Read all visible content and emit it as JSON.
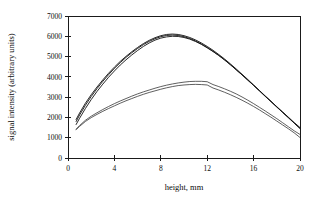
{
  "chart_data": {
    "type": "line",
    "title": "",
    "xlabel": "height, mm",
    "ylabel": "signal intensity (arbitrary units)",
    "xlim": [
      0,
      20
    ],
    "ylim": [
      0,
      7000
    ],
    "xticks": [
      0,
      4,
      8,
      12,
      16,
      20
    ],
    "yticks": [
      0,
      1000,
      2000,
      3000,
      4000,
      5000,
      6000,
      7000
    ],
    "xtick_labels": [
      "0",
      "4",
      "8",
      "12",
      "16",
      "20"
    ],
    "ytick_labels": [
      "0",
      "1000",
      "2000",
      "3000",
      "4000",
      "5000",
      "6000",
      "7000"
    ],
    "grid": false,
    "legend": false,
    "legend_position": "none",
    "frame": "box",
    "series": [
      {
        "name": "upper-curve-1",
        "x": [
          0.7,
          1.0,
          1.5,
          2.0,
          2.5,
          3.0,
          3.5,
          4.0,
          4.5,
          5.0,
          5.5,
          6.0,
          6.5,
          7.0,
          7.5,
          8.0,
          8.5,
          9.0,
          9.5,
          10.0,
          10.5,
          11.0,
          11.5,
          12.0,
          12.5,
          13.0,
          13.5,
          14.0,
          14.5,
          15.0,
          15.5,
          16.0,
          16.5,
          17.0,
          17.5,
          18.0,
          18.5,
          19.0,
          19.5,
          20.0
        ],
        "y": [
          1900,
          2220,
          2700,
          3120,
          3500,
          3850,
          4180,
          4480,
          4760,
          5010,
          5240,
          5450,
          5640,
          5800,
          5930,
          6030,
          6090,
          6110,
          6090,
          6030,
          5940,
          5820,
          5670,
          5500,
          5310,
          5100,
          4880,
          4640,
          4390,
          4130,
          3870,
          3600,
          3330,
          3060,
          2790,
          2520,
          2250,
          1990,
          1720,
          1470
        ]
      },
      {
        "name": "upper-curve-2",
        "x": [
          0.7,
          1.0,
          1.5,
          2.0,
          2.5,
          3.0,
          3.5,
          4.0,
          4.5,
          5.0,
          5.5,
          6.0,
          6.5,
          7.0,
          7.5,
          8.0,
          8.5,
          9.0,
          9.5,
          10.0,
          10.5,
          11.0,
          11.5,
          12.0,
          12.5,
          13.0,
          13.5,
          14.0,
          14.5,
          15.0,
          15.5,
          16.0,
          16.5,
          17.0,
          17.5,
          18.0,
          18.5,
          19.0,
          19.5,
          20.0
        ],
        "y": [
          1800,
          2120,
          2600,
          3030,
          3420,
          3780,
          4110,
          4420,
          4700,
          4960,
          5190,
          5400,
          5590,
          5750,
          5880,
          5980,
          6040,
          6060,
          6040,
          5980,
          5890,
          5770,
          5620,
          5450,
          5260,
          5060,
          4840,
          4600,
          4350,
          4100,
          3840,
          3580,
          3310,
          3040,
          2780,
          2510,
          2250,
          1990,
          1720,
          1450
        ]
      },
      {
        "name": "upper-curve-3",
        "x": [
          0.7,
          1.0,
          1.5,
          2.0,
          2.5,
          3.0,
          3.5,
          4.0,
          4.5,
          5.0,
          5.5,
          6.0,
          6.5,
          7.0,
          7.5,
          8.0,
          8.5,
          9.0,
          9.5,
          10.0,
          10.5,
          11.0,
          11.5,
          12.0,
          12.5,
          13.0,
          13.5,
          14.0,
          14.5,
          15.0,
          15.5,
          16.0,
          16.5,
          17.0,
          17.5,
          18.0,
          18.5,
          19.0,
          19.5,
          20.0
        ],
        "y": [
          1650,
          1960,
          2440,
          2880,
          3280,
          3640,
          3980,
          4290,
          4580,
          4840,
          5080,
          5300,
          5500,
          5670,
          5810,
          5910,
          5970,
          6000,
          5990,
          5940,
          5860,
          5740,
          5600,
          5430,
          5250,
          5050,
          4830,
          4600,
          4350,
          4100,
          3840,
          3580,
          3320,
          3050,
          2790,
          2530,
          2270,
          2010,
          1750,
          1500
        ]
      },
      {
        "name": "lower-curve-1",
        "x": [
          0.7,
          1.0,
          1.5,
          2.0,
          2.5,
          3.0,
          3.5,
          4.0,
          4.5,
          5.0,
          5.5,
          6.0,
          6.5,
          7.0,
          7.5,
          8.0,
          8.5,
          9.0,
          9.5,
          10.0,
          10.5,
          11.0,
          11.5,
          12.0,
          12.5,
          13.0,
          13.5,
          14.0,
          14.5,
          15.0,
          15.5,
          16.0,
          16.5,
          17.0,
          17.5,
          18.0,
          18.5,
          19.0,
          19.5,
          20.0
        ],
        "y": [
          1420,
          1600,
          1860,
          2060,
          2230,
          2390,
          2540,
          2680,
          2810,
          2930,
          3050,
          3160,
          3260,
          3350,
          3440,
          3520,
          3590,
          3650,
          3700,
          3740,
          3770,
          3780,
          3780,
          3760,
          3620,
          3520,
          3410,
          3290,
          3160,
          3010,
          2850,
          2680,
          2500,
          2320,
          2130,
          1940,
          1740,
          1540,
          1340,
          1160
        ]
      },
      {
        "name": "lower-curve-2",
        "x": [
          0.7,
          1.0,
          1.5,
          2.0,
          2.5,
          3.0,
          3.5,
          4.0,
          4.5,
          5.0,
          5.5,
          6.0,
          6.5,
          7.0,
          7.5,
          8.0,
          8.5,
          9.0,
          9.5,
          10.0,
          10.5,
          11.0,
          11.5,
          12.0,
          12.5,
          13.0,
          13.5,
          14.0,
          14.5,
          15.0,
          15.5,
          16.0,
          16.5,
          17.0,
          17.5,
          18.0,
          18.5,
          19.0,
          19.5,
          20.0
        ],
        "y": [
          1400,
          1560,
          1800,
          1990,
          2150,
          2300,
          2440,
          2570,
          2700,
          2820,
          2930,
          3040,
          3140,
          3230,
          3310,
          3390,
          3460,
          3520,
          3570,
          3600,
          3620,
          3630,
          3620,
          3600,
          3450,
          3350,
          3240,
          3120,
          2990,
          2850,
          2700,
          2540,
          2370,
          2190,
          2010,
          1820,
          1630,
          1440,
          1240,
          1010
        ]
      }
    ]
  },
  "axes": {
    "x_title": "height, mm",
    "y_title": "signal intensity (arbitrary units)"
  }
}
